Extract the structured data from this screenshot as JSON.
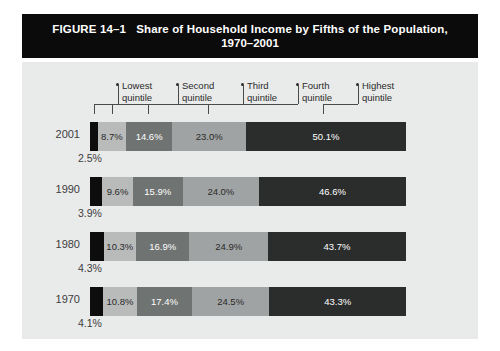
{
  "figure": {
    "number_label": "FIGURE 14–1",
    "title_line1": "Share of Household Income by Fifths of the Population,",
    "title_line2": "1970–2001"
  },
  "legend": {
    "items": [
      {
        "line1": "Lowest",
        "line2": "quintile"
      },
      {
        "line1": "Second",
        "line2": "quintile"
      },
      {
        "line1": "Third",
        "line2": "quintile"
      },
      {
        "line1": "Fourth",
        "line2": "quintile"
      },
      {
        "line1": "Highest",
        "line2": "quintile"
      }
    ]
  },
  "colors": {
    "banner": "#0b0b0b",
    "plot_background": "#e9eaea",
    "lowest": "#0d0d0d",
    "second": "#b9bbbb",
    "third": "#6f7372",
    "fourth": "#a0a3a3",
    "highest": "#2b2d2d",
    "text_dark": "#2a2a2a",
    "text_light": "#ffffff"
  },
  "chart_data": {
    "type": "bar",
    "title": "Share of Household Income by Fifths of the Population, 1970–2001",
    "xlabel": "",
    "ylabel": "",
    "orientation": "horizontal",
    "stacked": true,
    "xlim": [
      0,
      100
    ],
    "grid": false,
    "legend_position": "top",
    "categories": [
      "2001",
      "1990",
      "1980",
      "1970"
    ],
    "series": [
      {
        "name": "Lowest quintile",
        "values": [
          2.5,
          3.9,
          4.3,
          4.1
        ]
      },
      {
        "name": "Second quintile",
        "values": [
          8.7,
          9.6,
          10.3,
          10.8
        ]
      },
      {
        "name": "Third quintile",
        "values": [
          14.6,
          15.9,
          16.9,
          17.4
        ]
      },
      {
        "name": "Fourth quintile",
        "values": [
          23.0,
          24.0,
          24.9,
          24.5
        ]
      },
      {
        "name": "Highest quintile",
        "values": [
          50.1,
          46.6,
          43.7,
          43.3
        ]
      }
    ]
  },
  "rows": [
    {
      "year": "2001",
      "callout": "2.5%",
      "segments": [
        {
          "label": "2.5%",
          "value": 2.5,
          "show_label": false,
          "color": "#0d0d0d",
          "text": "#ffffff"
        },
        {
          "label": "8.7%",
          "value": 8.7,
          "show_label": true,
          "color": "#b9bbbb",
          "text": "#2a2a2a"
        },
        {
          "label": "14.6%",
          "value": 14.6,
          "show_label": true,
          "color": "#6f7372",
          "text": "#ffffff"
        },
        {
          "label": "23.0%",
          "value": 23.0,
          "show_label": true,
          "color": "#a0a3a3",
          "text": "#2a2a2a"
        },
        {
          "label": "50.1%",
          "value": 50.1,
          "show_label": true,
          "color": "#2b2d2d",
          "text": "#ffffff"
        }
      ]
    },
    {
      "year": "1990",
      "callout": "3.9%",
      "segments": [
        {
          "label": "3.9%",
          "value": 3.9,
          "show_label": false,
          "color": "#0d0d0d",
          "text": "#ffffff"
        },
        {
          "label": "9.6%",
          "value": 9.6,
          "show_label": true,
          "color": "#b9bbbb",
          "text": "#2a2a2a"
        },
        {
          "label": "15.9%",
          "value": 15.9,
          "show_label": true,
          "color": "#6f7372",
          "text": "#ffffff"
        },
        {
          "label": "24.0%",
          "value": 24.0,
          "show_label": true,
          "color": "#a0a3a3",
          "text": "#2a2a2a"
        },
        {
          "label": "46.6%",
          "value": 46.6,
          "show_label": true,
          "color": "#2b2d2d",
          "text": "#ffffff"
        }
      ]
    },
    {
      "year": "1980",
      "callout": "4.3%",
      "segments": [
        {
          "label": "4.3%",
          "value": 4.3,
          "show_label": false,
          "color": "#0d0d0d",
          "text": "#ffffff"
        },
        {
          "label": "10.3%",
          "value": 10.3,
          "show_label": true,
          "color": "#b9bbbb",
          "text": "#2a2a2a"
        },
        {
          "label": "16.9%",
          "value": 16.9,
          "show_label": true,
          "color": "#6f7372",
          "text": "#ffffff"
        },
        {
          "label": "24.9%",
          "value": 24.9,
          "show_label": true,
          "color": "#a0a3a3",
          "text": "#2a2a2a"
        },
        {
          "label": "43.7%",
          "value": 43.7,
          "show_label": true,
          "color": "#2b2d2d",
          "text": "#ffffff"
        }
      ]
    },
    {
      "year": "1970",
      "callout": "4.1%",
      "segments": [
        {
          "label": "4.1%",
          "value": 4.1,
          "show_label": false,
          "color": "#0d0d0d",
          "text": "#ffffff"
        },
        {
          "label": "10.8%",
          "value": 10.8,
          "show_label": true,
          "color": "#b9bbbb",
          "text": "#2a2a2a"
        },
        {
          "label": "17.4%",
          "value": 17.4,
          "show_label": true,
          "color": "#6f7372",
          "text": "#ffffff"
        },
        {
          "label": "24.5%",
          "value": 24.5,
          "show_label": true,
          "color": "#a0a3a3",
          "text": "#2a2a2a"
        },
        {
          "label": "43.3%",
          "value": 43.3,
          "show_label": true,
          "color": "#2b2d2d",
          "text": "#ffffff"
        }
      ]
    }
  ]
}
